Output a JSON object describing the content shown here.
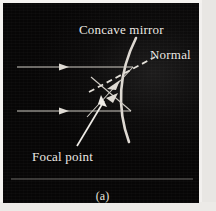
{
  "figure": {
    "caption": "(a)",
    "background_color": "#070606",
    "ink_color": "#ece9e4",
    "labels": {
      "concave_mirror": "Concave mirror",
      "normal": "Normal",
      "focal_point": "Focal point"
    }
  },
  "diagram": {
    "type": "ray-diagram",
    "mirror": {
      "name": "concave-mirror-arc",
      "top_point": [
        133,
        35
      ],
      "bottom_point": [
        126,
        139
      ],
      "control_point": [
        108,
        87
      ],
      "stroke": "#ded9d2",
      "stroke_width": 2.6
    },
    "incident_rays": [
      {
        "name": "incident-ray-upper",
        "from": [
          14,
          64
        ],
        "to": [
          130,
          64
        ],
        "arrow_at": [
          62,
          64
        ]
      },
      {
        "name": "incident-ray-lower",
        "from": [
          14,
          108
        ],
        "to": [
          128,
          108
        ],
        "arrow_at": [
          62,
          108
        ]
      }
    ],
    "reflected_rays": [
      {
        "name": "reflected-ray-upper",
        "from": [
          130,
          64
        ],
        "to": [
          86,
          112
        ],
        "arrow_at": [
          110,
          86
        ]
      },
      {
        "name": "reflected-ray-lower",
        "from": [
          128,
          108
        ],
        "to": [
          90,
          76
        ],
        "arrow_at": [
          107,
          93
        ]
      }
    ],
    "normal_line": {
      "name": "normal-dashed-line",
      "from": [
        88,
        88
      ],
      "to": [
        152,
        54
      ],
      "dash": "6 4"
    },
    "focal_point": {
      "name": "focal-point-marker",
      "position": [
        106,
        92
      ]
    },
    "focal_pointer": {
      "name": "focal-point-pointer-arrow",
      "from": [
        74,
        143
      ],
      "to": [
        103,
        96
      ]
    },
    "baseline": {
      "name": "plate-baseline",
      "from": [
        8,
        176
      ],
      "to": [
        190,
        176
      ]
    }
  }
}
